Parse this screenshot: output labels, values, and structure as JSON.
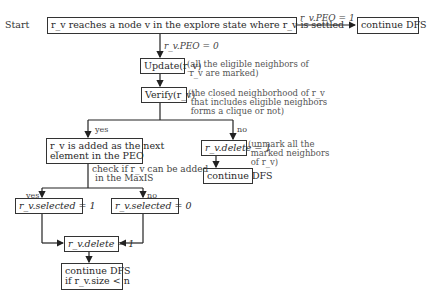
{
  "diagram": {
    "start_label": "Start",
    "nodes": {
      "settled": "r_v reaches a node v in the explore state where r_v is settled",
      "continue_top": "continue DFS",
      "update": "Update(r_v)",
      "verify": "Verify(r_v)",
      "add_peo_line1": "r_v is added as the next",
      "add_peo_line2": "element in the PEO",
      "delete_right": "r_v.delete = 1",
      "continue_right": "continue DFS",
      "selected_1": "r_v.selected = 1",
      "selected_0": "r_v.selected = 0",
      "delete_center": "r_v.delete = 1",
      "continue_final_line1": "continue DFS",
      "continue_final_line2": "if r_v.size < n"
    },
    "edge_labels": {
      "peo_1": "r_v.PEO = 1",
      "peo_0": "r_v.PEO = 0",
      "verify_yes": "yes",
      "verify_no": "no",
      "check_line1": "check if r_v can be added",
      "check_line2": "in the MaxIS",
      "maxis_yes": "yes",
      "maxis_no": "no"
    },
    "notes": {
      "update": "(all the eligible neighbors of\n r_v are marked)",
      "verify": "(the closed neighborhood of r_v\n that includes eligible neighbors\n forms a clique or not)",
      "delete_right": "(unmark all the\n marked neighbors\n of r_v)"
    }
  }
}
